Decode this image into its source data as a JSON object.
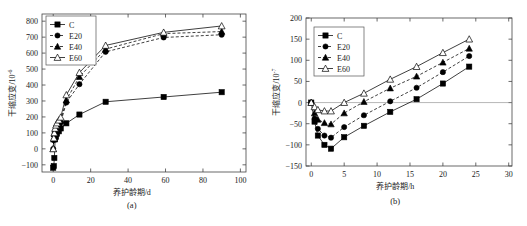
{
  "figure": {
    "panels": [
      {
        "caption": "(a)",
        "xlabel": "养护龄期/d",
        "ylabel_main": "干缩应变/10",
        "ylabel_exp": "-6"
      },
      {
        "caption": "(b)",
        "xlabel": "养护龄期/h",
        "ylabel_main": "干缩应变/10",
        "ylabel_exp": "-7"
      }
    ],
    "legend": {
      "items": [
        {
          "label": "C",
          "marker": "filled-square",
          "line": "solid",
          "color": "#000000"
        },
        {
          "label": "E20",
          "marker": "filled-circle",
          "line": "dashed",
          "color": "#000000"
        },
        {
          "label": "E40",
          "marker": "filled-triangle",
          "line": "dashed",
          "color": "#000000"
        },
        {
          "label": "E60",
          "marker": "open-triangle",
          "line": "solid",
          "color": "#000000"
        }
      ]
    }
  },
  "chart_data": [
    {
      "id": "panel-a",
      "type": "line",
      "title": "",
      "caption": "(a)",
      "xlabel": "养护龄期/d",
      "ylabel": "干缩应变/10^-6",
      "xlim": [
        -6,
        103
      ],
      "ylim": [
        -145,
        845
      ],
      "xticks": [
        0,
        20,
        40,
        60,
        80,
        100
      ],
      "yticks": [
        -100,
        0,
        100,
        200,
        300,
        400,
        500,
        600,
        700,
        800
      ],
      "grid": false,
      "legend_position": "top-left",
      "series": [
        {
          "name": "C",
          "marker": "filled-square",
          "line": "solid",
          "x": [
            0,
            0.3,
            0.6,
            1,
            1.5,
            2,
            3,
            4,
            7,
            14,
            28,
            59,
            90
          ],
          "y": [
            -118,
            -108,
            -57,
            60,
            75,
            95,
            110,
            128,
            160,
            215,
            295,
            325,
            355,
            363
          ]
        },
        {
          "name": "E20",
          "marker": "filled-circle",
          "line": "dashed",
          "x": [
            0,
            0.3,
            0.6,
            1,
            1.5,
            2,
            3,
            4,
            7,
            14,
            28,
            59,
            90
          ],
          "y": [
            0,
            55,
            85,
            105,
            125,
            135,
            150,
            165,
            290,
            405,
            608,
            698,
            715
          ]
        },
        {
          "name": "E40",
          "marker": "filled-triangle",
          "line": "dashed",
          "x": [
            0,
            0.3,
            0.6,
            1,
            1.5,
            2,
            3,
            4,
            7,
            14,
            28,
            59,
            90
          ],
          "y": [
            0,
            60,
            92,
            115,
            135,
            148,
            162,
            178,
            305,
            452,
            625,
            722,
            735
          ]
        },
        {
          "name": "E60",
          "marker": "open-triangle",
          "line": "solid",
          "x": [
            0,
            0.3,
            0.6,
            1,
            1.5,
            2,
            3,
            4,
            7,
            14,
            28,
            59,
            90
          ],
          "y": [
            0,
            68,
            100,
            128,
            148,
            162,
            180,
            198,
            338,
            478,
            648,
            730,
            770
          ]
        }
      ]
    },
    {
      "id": "panel-b",
      "type": "line",
      "title": "",
      "caption": "(b)",
      "xlabel": "养护龄期/h",
      "ylabel": "干缩应变/10^-7",
      "xlim": [
        -0.8,
        30.5
      ],
      "ylim": [
        -150,
        200
      ],
      "xticks": [
        0,
        5,
        10,
        15,
        20,
        25,
        30
      ],
      "yticks": [
        -150,
        -100,
        -50,
        0,
        50,
        100,
        150,
        200
      ],
      "grid": false,
      "legend_position": "top-left",
      "series": [
        {
          "name": "C",
          "marker": "filled-square",
          "line": "solid",
          "x": [
            0,
            0.5,
            1,
            2,
            3,
            5,
            8,
            12,
            16,
            20,
            24
          ],
          "y": [
            0,
            -45,
            -78,
            -100,
            -109,
            -82,
            -55,
            -22,
            8,
            45,
            85
          ]
        },
        {
          "name": "E20",
          "marker": "filled-circle",
          "line": "dashed",
          "x": [
            0,
            0.5,
            1,
            2,
            3,
            5,
            8,
            12,
            16,
            20,
            24
          ],
          "y": [
            0,
            -38,
            -62,
            -78,
            -83,
            -58,
            -30,
            3,
            35,
            72,
            110
          ]
        },
        {
          "name": "E40",
          "marker": "filled-triangle",
          "line": "dashed",
          "x": [
            0,
            0.5,
            1,
            2,
            3,
            5,
            8,
            12,
            16,
            20,
            24
          ],
          "y": [
            0,
            -25,
            -40,
            -48,
            -51,
            -25,
            2,
            34,
            62,
            95,
            128
          ]
        },
        {
          "name": "E60",
          "marker": "open-triangle",
          "line": "solid",
          "x": [
            0,
            0.5,
            1,
            2,
            3,
            5,
            8,
            12,
            16,
            20,
            24
          ],
          "y": [
            0,
            -10,
            -17,
            -20,
            -20,
            0,
            22,
            55,
            85,
            118,
            150
          ]
        }
      ]
    }
  ]
}
